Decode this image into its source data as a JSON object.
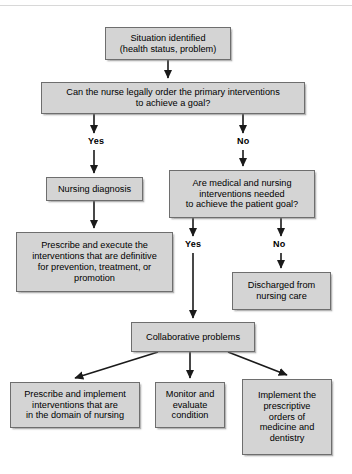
{
  "diagram": {
    "title_rule": true,
    "colors": {
      "node_fill": "#d4d4d4",
      "node_border": "#6e6e6e",
      "arrow": "#1a1a1a",
      "background": "#ffffff"
    },
    "nodes": [
      {
        "id": "situation",
        "text": "Situation identified\n(health status, problem)",
        "x": 105,
        "y": 27,
        "w": 126,
        "h": 33
      },
      {
        "id": "can-nurse-legally-order",
        "text": "Can the nurse legally order the primary interventions\nto achieve a goal?",
        "x": 41,
        "y": 82,
        "w": 264,
        "h": 32
      },
      {
        "id": "nursing-diagnosis",
        "text": "Nursing diagnosis",
        "x": 46,
        "y": 177,
        "w": 97,
        "h": 24
      },
      {
        "id": "are-medical-and-nursing",
        "text": "Are medical and nursing\ninterventions needed\nto achieve the patient goal?",
        "x": 169,
        "y": 170,
        "w": 146,
        "h": 48
      },
      {
        "id": "prescribe-and-execute",
        "text": "Prescribe and execute the\ninterventions that are definitive\nfor prevention, treatment, or\npromotion",
        "x": 16,
        "y": 232,
        "w": 157,
        "h": 60
      },
      {
        "id": "discharged",
        "text": "Discharged from\nnursing care",
        "x": 232,
        "y": 272,
        "w": 99,
        "h": 38
      },
      {
        "id": "collaborative-problems",
        "text": "Collaborative problems",
        "x": 131,
        "y": 322,
        "w": 124,
        "h": 30
      },
      {
        "id": "prescribe-and-implement",
        "text": "Prescribe and implement\ninterventions that are\nin the domain of nursing",
        "x": 10,
        "y": 382,
        "w": 130,
        "h": 46
      },
      {
        "id": "monitor-and-evaluate",
        "text": "Monitor and\nevaluate\ncondition",
        "x": 155,
        "y": 382,
        "w": 70,
        "h": 46
      },
      {
        "id": "implement-the-prescriptive",
        "text": "Implement the\nprescriptive\norders of\nmedicine and\ndentistry",
        "x": 242,
        "y": 379,
        "w": 90,
        "h": 76
      }
    ],
    "branch_labels": [
      {
        "id": "yes-1",
        "text": "Yes",
        "x": 88,
        "y": 136
      },
      {
        "id": "no-1",
        "text": "No",
        "x": 237,
        "y": 136
      },
      {
        "id": "yes-2",
        "text": "Yes",
        "x": 185,
        "y": 239
      },
      {
        "id": "no-2",
        "text": "No",
        "x": 273,
        "y": 239
      }
    ],
    "edges": [
      {
        "id": "situation-to-question",
        "from": "situation",
        "to": "can-nurse-legally-order",
        "path": "M168,60 L168,78",
        "arrow": true
      },
      {
        "id": "question-to-yes",
        "from": "can-nurse-legally-order",
        "to": "yes-1",
        "path": "M94,114 L94,133",
        "arrow": true
      },
      {
        "id": "question-to-no",
        "from": "can-nurse-legally-order",
        "to": "no-1",
        "path": "M243,114 L243,133",
        "arrow": true
      },
      {
        "id": "yes-to-nursing-diagnosis",
        "from": "yes-1",
        "to": "nursing-diagnosis",
        "path": "M94,150 L94,173",
        "arrow": true
      },
      {
        "id": "no-to-are-medical",
        "from": "no-1",
        "to": "are-medical-and-nursing",
        "path": "M243,150 L243,166",
        "arrow": true
      },
      {
        "id": "nursing-diagnosis-to-prescribe",
        "from": "nursing-diagnosis",
        "to": "prescribe-and-execute",
        "path": "M94,201 L94,228",
        "arrow": true
      },
      {
        "id": "are-medical-to-yes2",
        "from": "are-medical-and-nursing",
        "to": "yes-2",
        "path": "M193,218 L193,236",
        "arrow": true
      },
      {
        "id": "are-medical-to-no2",
        "from": "are-medical-and-nursing",
        "to": "no-2",
        "path": "M281,218 L281,236",
        "arrow": true
      },
      {
        "id": "yes2-to-collaborative",
        "from": "yes-2",
        "to": "collaborative-problems",
        "path": "M193,253 L193,318",
        "arrow": true
      },
      {
        "id": "no2-to-discharged",
        "from": "no-2",
        "to": "discharged",
        "path": "M281,253 L281,268",
        "arrow": true
      },
      {
        "id": "collaborative-to-prescribe-implement",
        "from": "collaborative-problems",
        "to": "prescribe-and-implement",
        "path": "M158,352 L75,378",
        "arrow": true
      },
      {
        "id": "collaborative-to-monitor",
        "from": "collaborative-problems",
        "to": "monitor-and-evaluate",
        "path": "M190,352 L190,378",
        "arrow": true
      },
      {
        "id": "collaborative-to-implement-prescriptive",
        "from": "collaborative-problems",
        "to": "implement-the-prescriptive",
        "path": "M228,352 L287,375",
        "arrow": true
      }
    ]
  }
}
